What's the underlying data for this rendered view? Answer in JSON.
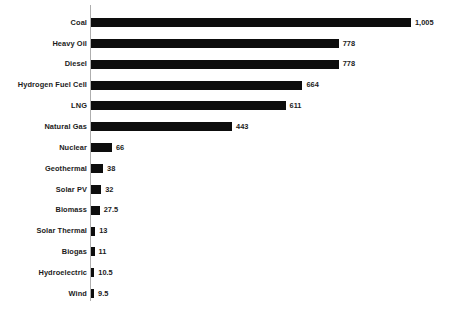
{
  "chart_data": {
    "type": "bar",
    "orientation": "horizontal",
    "title": "",
    "subtitle": "",
    "xlabel": "",
    "ylabel": "",
    "grid": false,
    "legend": null,
    "xlim": [
      0,
      1100
    ],
    "axis_ticks": [],
    "value_label_format": "comma-separated thousands",
    "categories": [
      "Coal",
      "Heavy Oil",
      "Diesel",
      "Hydrogen Fuel Cell",
      "LNG",
      "Natural Gas",
      "Nuclear",
      "Geothermal",
      "Solar PV",
      "Biomass",
      "Solar Thermal",
      "Biogas",
      "Hydroelectric",
      "Wind"
    ],
    "values": [
      1005,
      778,
      778,
      664,
      611,
      443,
      66,
      38,
      32,
      27.5,
      13,
      11,
      10.5,
      9.5
    ],
    "value_labels": [
      "1,005",
      "778",
      "778",
      "664",
      "611",
      "443",
      "66",
      "38",
      "32",
      "27.5",
      "13",
      "11",
      "10.5",
      "9.5"
    ],
    "series": [
      {
        "name": "",
        "values": [
          1005,
          778,
          778,
          664,
          611,
          443,
          66,
          38,
          32,
          27.5,
          13,
          11,
          10.5,
          9.5
        ]
      }
    ],
    "colors": {
      "bar": "#0d0d0d",
      "axis": "#aeaeae",
      "text": "#1b1b1b",
      "background": "#ffffff"
    }
  }
}
